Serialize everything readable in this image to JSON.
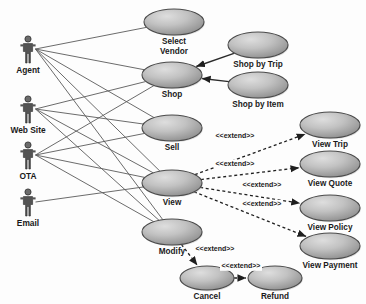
{
  "diagram": {
    "type": "uml-use-case",
    "colors": {
      "background": "#fdfdfd",
      "ellipse_light": "#d8d8d8",
      "ellipse_dark": "#8d8d8d",
      "ellipse_stroke": "#4a4a4a",
      "actor_fill": "#545454",
      "association_line": "#5a5a5a",
      "extend_line": "#1f1f1f",
      "text": "#1a1a1a"
    },
    "actors": [
      {
        "id": "agent",
        "label": "Agent",
        "x": 28,
        "y": 52
      },
      {
        "id": "website",
        "label": "Web Site",
        "x": 28,
        "y": 112
      },
      {
        "id": "ota",
        "label": "OTA",
        "x": 28,
        "y": 158
      },
      {
        "id": "email",
        "label": "Email",
        "x": 28,
        "y": 205
      }
    ],
    "use_cases": [
      {
        "id": "select_vendor",
        "label": "Select Vendor",
        "label_lines": [
          "Select",
          "Vendor"
        ],
        "cx": 174,
        "cy": 22,
        "rx": 30,
        "ry": 13
      },
      {
        "id": "shop",
        "label": "Shop",
        "label_lines": [
          "Shop"
        ],
        "cx": 172,
        "cy": 75,
        "rx": 30,
        "ry": 13
      },
      {
        "id": "shop_by_trip",
        "label": "Shop by Trip",
        "label_lines": [
          "Shop by Trip"
        ],
        "cx": 258,
        "cy": 45,
        "rx": 30,
        "ry": 13
      },
      {
        "id": "shop_by_item",
        "label": "Shop by Item",
        "label_lines": [
          "Shop by Item"
        ],
        "cx": 258,
        "cy": 85,
        "rx": 30,
        "ry": 13
      },
      {
        "id": "sell",
        "label": "Sell",
        "label_lines": [
          "Sell"
        ],
        "cx": 172,
        "cy": 128,
        "rx": 30,
        "ry": 13
      },
      {
        "id": "view",
        "label": "View",
        "label_lines": [
          "View"
        ],
        "cx": 172,
        "cy": 183,
        "rx": 30,
        "ry": 13
      },
      {
        "id": "modify",
        "label": "Modify",
        "label_lines": [
          "Modify"
        ],
        "cx": 172,
        "cy": 232,
        "rx": 30,
        "ry": 13
      },
      {
        "id": "view_trip",
        "label": "View Trip",
        "label_lines": [
          "View Trip"
        ],
        "cx": 330,
        "cy": 125,
        "rx": 30,
        "ry": 13
      },
      {
        "id": "view_quote",
        "label": "View Quote",
        "label_lines": [
          "View Quote"
        ],
        "cx": 330,
        "cy": 164,
        "rx": 30,
        "ry": 13
      },
      {
        "id": "view_policy",
        "label": "View Policy",
        "label_lines": [
          "View Policy"
        ],
        "cx": 330,
        "cy": 208,
        "rx": 30,
        "ry": 13
      },
      {
        "id": "view_payment",
        "label": "View Payment",
        "label_lines": [
          "View Payment"
        ],
        "cx": 330,
        "cy": 246,
        "rx": 30,
        "ry": 13
      },
      {
        "id": "cancel",
        "label": "Cancel",
        "label_lines": [
          "Cancel"
        ],
        "cx": 207,
        "cy": 278,
        "rx": 27,
        "ry": 12
      },
      {
        "id": "refund",
        "label": "Refund",
        "label_lines": [
          "Refund"
        ],
        "cx": 275,
        "cy": 278,
        "rx": 27,
        "ry": 12
      }
    ],
    "associations": [
      {
        "from": "agent",
        "to": "select_vendor"
      },
      {
        "from": "agent",
        "to": "shop"
      },
      {
        "from": "agent",
        "to": "sell"
      },
      {
        "from": "agent",
        "to": "view"
      },
      {
        "from": "agent",
        "to": "modify"
      },
      {
        "from": "website",
        "to": "shop"
      },
      {
        "from": "website",
        "to": "sell"
      },
      {
        "from": "website",
        "to": "view"
      },
      {
        "from": "website",
        "to": "modify"
      },
      {
        "from": "ota",
        "to": "shop"
      },
      {
        "from": "ota",
        "to": "sell"
      },
      {
        "from": "ota",
        "to": "view"
      },
      {
        "from": "ota",
        "to": "modify"
      },
      {
        "from": "email",
        "to": "view"
      }
    ],
    "includes": [
      {
        "from": "shop_by_trip",
        "to": "shop"
      },
      {
        "from": "shop_by_item",
        "to": "shop"
      }
    ],
    "extends": [
      {
        "from": "view",
        "to": "view_trip",
        "label": "<<extend>>",
        "lx": 235,
        "ly": 138
      },
      {
        "from": "view",
        "to": "view_quote",
        "label": "<<extend>>",
        "lx": 235,
        "ly": 166
      },
      {
        "from": "view",
        "to": "view_policy",
        "label": "<<extend>>",
        "lx": 262,
        "ly": 187
      },
      {
        "from": "view",
        "to": "view_payment",
        "label": "<<extend>>",
        "lx": 262,
        "ly": 206
      },
      {
        "from": "modify",
        "to": "cancel",
        "label": "<<extend>>",
        "lx": 215,
        "ly": 251
      },
      {
        "from": "cancel",
        "to": "refund",
        "label": "<<extend>>",
        "lx": 241,
        "ly": 268
      }
    ]
  }
}
